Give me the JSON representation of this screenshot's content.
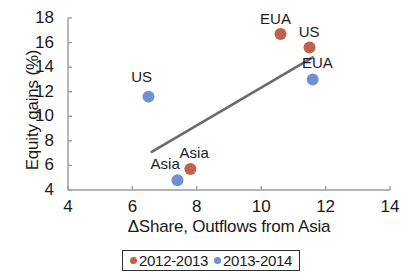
{
  "chart_data": {
    "type": "scatter",
    "title": "",
    "xlabel": "ΔShare, Outflows from Asia",
    "ylabel": "Equity gains (%)",
    "xlim": [
      4,
      14
    ],
    "ylim": [
      4,
      18
    ],
    "xticks": [
      "4",
      "6",
      "8",
      "10",
      "12",
      "14"
    ],
    "yticks": [
      "4",
      "6",
      "8",
      "10",
      "12",
      "14",
      "16",
      "18"
    ],
    "grid": false,
    "legend_position": "bottom",
    "colors": {
      "series_2012_2013": "#c0614a",
      "series_2013_2014": "#6f8fd6",
      "trendline": "#6b6b6b",
      "axis": "#9a9a9a"
    },
    "series": [
      {
        "name": "2012-2013",
        "color": "#c0614a",
        "points": [
          {
            "label": "EUA",
            "x": 10.6,
            "y": 16.7
          },
          {
            "label": "US",
            "x": 11.5,
            "y": 15.6
          },
          {
            "label": "Asia",
            "x": 7.8,
            "y": 5.7
          }
        ]
      },
      {
        "name": "2013-2014",
        "color": "#6f8fd6",
        "points": [
          {
            "label": "US",
            "x": 6.5,
            "y": 11.6
          },
          {
            "label": "EUA",
            "x": 11.6,
            "y": 13.0
          },
          {
            "label": "Asia",
            "x": 7.4,
            "y": 4.8
          }
        ]
      }
    ],
    "trendline": {
      "x1": 6.6,
      "y1": 7.1,
      "x2": 11.6,
      "y2": 14.8
    },
    "annotations": [
      {
        "text": "EUA",
        "x": 10.4,
        "y": 17.9
      },
      {
        "text": "US",
        "x": 11.6,
        "y": 16.9
      },
      {
        "text": "EUA",
        "x": 11.7,
        "y": 14.3
      },
      {
        "text": "US",
        "x": 6.4,
        "y": 13.2
      },
      {
        "text": "Asia",
        "x": 7.9,
        "y": 7.0
      },
      {
        "text": "Asia",
        "x": 7.0,
        "y": 6.1
      }
    ]
  },
  "legend": {
    "entries": [
      {
        "label": "2012-2013",
        "color": "#c0614a"
      },
      {
        "label": "2013-2014",
        "color": "#6f8fd6"
      }
    ]
  }
}
